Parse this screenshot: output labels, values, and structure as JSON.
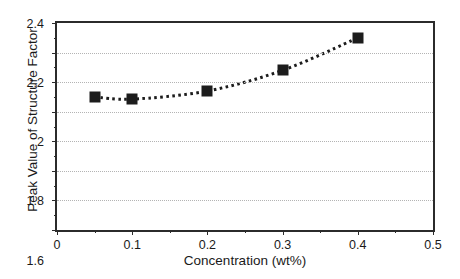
{
  "chart_data": {
    "type": "line",
    "title": "",
    "subtitle": "",
    "xlabel": "Concentration (wt%)",
    "ylabel": "Peak Value of Structure Factor",
    "x": [
      0.05,
      0.1,
      0.2,
      0.3,
      0.4
    ],
    "values": [
      1.9,
      1.885,
      1.94,
      2.08,
      2.3
    ],
    "series": [
      {
        "name": "Peak Value of Structure Factor",
        "x": [
          0.05,
          0.1,
          0.2,
          0.3,
          0.4
        ],
        "values": [
          1.9,
          1.885,
          1.94,
          2.08,
          2.3
        ],
        "marker": "filled-square",
        "marker_color": "#1c1c1c",
        "line_style": "dotted",
        "line_color": "#1c1c1c"
      }
    ],
    "xlim": [
      0,
      0.5
    ],
    "ylim": [
      1,
      2.4
    ],
    "xticks": [
      0,
      0.1,
      0.2,
      0.3,
      0.4,
      0.5
    ],
    "xtick_labels": [
      "0",
      "0.1",
      "0.2",
      "0.3",
      "0.4",
      "0.5"
    ],
    "xminor_ticks": [
      0.05,
      0.15,
      0.25,
      0.35,
      0.45
    ],
    "yticks": [
      1,
      1.2,
      1.4,
      1.6,
      1.8,
      2,
      2.2,
      2.4
    ],
    "ytick_labels": [
      "1",
      "1.2",
      "1.4",
      "1.6",
      "1.8",
      "2",
      "2.2",
      "2.4"
    ],
    "yminor_ticks": [
      1.1,
      1.3,
      1.5,
      1.7,
      1.9,
      2.1,
      2.3
    ],
    "grid": "horizontal-dotted",
    "gridlines_y": [
      1.2,
      1.4,
      1.6,
      1.8,
      2,
      2.2
    ],
    "legend": null,
    "legend_position": "none",
    "annotations": [],
    "frame_color": "#2b2b2b",
    "grid_color": "#b4b4b4",
    "background": "#ffffff"
  }
}
